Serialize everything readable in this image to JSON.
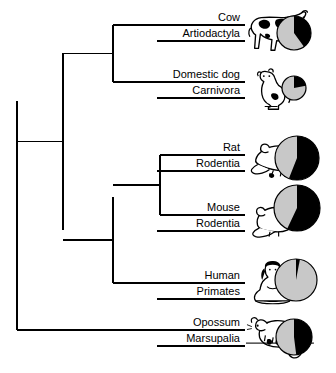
{
  "figure": {
    "type": "phylogenetic-tree-with-pie-charts",
    "background_color": "#ffffff",
    "line_color": "#000000",
    "pie_filled_color": "#000000",
    "pie_empty_color": "#c8c8c8",
    "pie_stroke_color": "#000000"
  },
  "taxa": [
    {
      "id": "cow",
      "name": "Cow",
      "order": "Artiodactyla",
      "icon": "cow-icon",
      "pie_percent": 40,
      "pie_radius": 17,
      "label_x": 240,
      "label_y": 24,
      "branch_y": 25,
      "branch_x_start": 113,
      "branch_x_end": 245,
      "animal_x": 247,
      "animal_y": 8,
      "pie_cx": 294,
      "pie_cy": 33
    },
    {
      "id": "domestic-dog",
      "name": "Domestic dog",
      "order": "Carnivora",
      "icon": "dog-icon",
      "pie_percent": 22,
      "pie_radius": 12,
      "label_x": 240,
      "label_y": 81,
      "branch_y": 82,
      "branch_x_start": 113,
      "branch_x_end": 245,
      "animal_x": 250,
      "animal_y": 66,
      "pie_cx": 294,
      "pie_cy": 88
    },
    {
      "id": "rat",
      "name": "Rat",
      "order": "Rodentia",
      "icon": "rat-icon",
      "pie_percent": 56,
      "pie_radius": 22,
      "label_x": 240,
      "label_y": 154,
      "branch_y": 155,
      "branch_x_start": 160,
      "branch_x_end": 245,
      "animal_x": 248,
      "animal_y": 140,
      "pie_cx": 297,
      "pie_cy": 158
    },
    {
      "id": "mouse",
      "name": "Mouse",
      "order": "Rodentia",
      "icon": "mouse-icon",
      "pie_percent": 57,
      "pie_radius": 23,
      "label_x": 240,
      "label_y": 214,
      "branch_y": 215,
      "branch_x_start": 160,
      "branch_x_end": 245,
      "animal_x": 248,
      "animal_y": 202,
      "pie_cx": 297,
      "pie_cy": 208
    },
    {
      "id": "human",
      "name": "Human",
      "order": "Primates",
      "icon": "human-icon",
      "pie_percent": 3,
      "pie_radius": 21,
      "label_x": 240,
      "label_y": 282,
      "branch_y": 283,
      "branch_x_start": 113,
      "branch_x_end": 245,
      "animal_x": 248,
      "animal_y": 262,
      "pie_cx": 296,
      "pie_cy": 280
    },
    {
      "id": "opossum",
      "name": "Opossum",
      "order": "Marsupalia",
      "icon": "opossum-icon",
      "pie_percent": 48,
      "pie_radius": 18,
      "label_x": 240,
      "label_y": 329,
      "branch_y": 330,
      "branch_x_start": 17,
      "branch_x_end": 245,
      "animal_x": 248,
      "animal_y": 315,
      "pie_cx": 294,
      "pie_cy": 337
    }
  ],
  "nodes": [
    {
      "id": "root-node",
      "x": 17,
      "y_top": 101,
      "y_bottom": 330,
      "parent_x": 17
    },
    {
      "id": "placental-node",
      "x": 63,
      "y_top": 53,
      "y_bottom": 230,
      "parent_x": 17
    },
    {
      "id": "laurasiatheria-node",
      "x": 113,
      "y_top": 25,
      "y_bottom": 82,
      "parent_x": 63
    },
    {
      "id": "euarchontoglires-node",
      "x": 113,
      "y_top": 197,
      "y_bottom": 283,
      "parent_x": 63
    },
    {
      "id": "rodentia-node",
      "x": 160,
      "y_top": 155,
      "y_bottom": 215,
      "parent_x": 113
    }
  ],
  "chart_data": {
    "type": "pie",
    "title": "",
    "legend": [],
    "units": "percent filled (black)",
    "series": [
      {
        "name": "Cow",
        "values": [
          40,
          60
        ]
      },
      {
        "name": "Domestic dog",
        "values": [
          22,
          78
        ]
      },
      {
        "name": "Rat",
        "values": [
          56,
          44
        ]
      },
      {
        "name": "Mouse",
        "values": [
          57,
          43
        ]
      },
      {
        "name": "Human",
        "values": [
          3,
          97
        ]
      },
      {
        "name": "Opossum",
        "values": [
          48,
          52
        ]
      }
    ],
    "categories": [
      "filled",
      "unfilled"
    ]
  }
}
